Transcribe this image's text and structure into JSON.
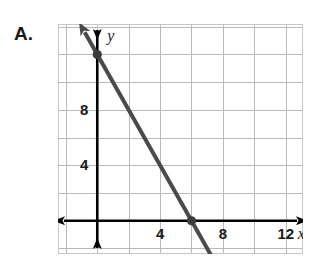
{
  "choice": {
    "label": "A."
  },
  "chart_data": {
    "type": "line",
    "title": "",
    "xlabel": "x",
    "ylabel": "y",
    "grid": true,
    "legend": "none",
    "xlim": [
      -2.5,
      13.1
    ],
    "ylim": [
      -2.4,
      14.2
    ],
    "x_ticks": [
      4,
      8,
      12
    ],
    "x_tick_labels": [
      "4",
      "8",
      "12"
    ],
    "y_ticks": [
      4,
      8
    ],
    "y_tick_labels": [
      "4",
      "8"
    ],
    "grid_step": 2,
    "series": [
      {
        "name": "line",
        "equation": "y = -2x + 12",
        "slope": -2,
        "y_intercept": 12,
        "x_intercept": 6,
        "color": "#4a4a4a",
        "arrow_start": true,
        "arrow_end": true,
        "endpoints": [
          {
            "x": -0.8,
            "y": 13.6
          },
          {
            "x": 8.4,
            "y": -4.8
          }
        ],
        "points": [
          {
            "x": 0,
            "y": 12,
            "marker": "dot"
          },
          {
            "x": 6,
            "y": 0,
            "marker": "dot"
          }
        ]
      }
    ],
    "axis_style": {
      "axis_color": "#000000",
      "grid_color": "#b9b9bd",
      "frame_color": "#c8c8cc",
      "double_headed_axes": true
    }
  }
}
